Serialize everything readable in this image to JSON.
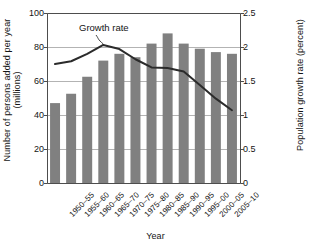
{
  "chart_data": {
    "type": "bar",
    "title": "",
    "xlabel": "Year",
    "ylabel": "Number of persons added per year (millions)",
    "ylabel_secondary": "Population growth rate (percent)",
    "categories": [
      "1950–55",
      "1955–60",
      "1960–65",
      "1965–70",
      "1970–75",
      "1975–80",
      "1980–85",
      "1985–90",
      "1990–95",
      "1995–00",
      "2000–05",
      "2005–10"
    ],
    "series": [
      {
        "name": "Number of persons added per year (millions)",
        "type": "bar",
        "axis": "left",
        "values": [
          47,
          52.5,
          62.5,
          72,
          76,
          74,
          82,
          88,
          82,
          79,
          77,
          76
        ]
      },
      {
        "name": "Growth rate",
        "type": "line",
        "axis": "right",
        "values": [
          1.75,
          1.79,
          1.9,
          2.03,
          1.97,
          1.82,
          1.7,
          1.69,
          1.64,
          1.44,
          1.24,
          1.07
        ]
      }
    ],
    "ylim": [
      0,
      100
    ],
    "yticks": [
      "0",
      "20",
      "40",
      "60",
      "80",
      "100"
    ],
    "ylim_secondary": [
      0,
      2.5
    ],
    "yticks_secondary": [
      "0",
      "0.5",
      "1",
      "1.5",
      "2",
      "2.5"
    ],
    "grid": true,
    "legend": "none",
    "annotations": [
      {
        "text": "Growth rate",
        "target_category": "1965–70"
      }
    ],
    "colors": {
      "bar": "#808080",
      "line": "#2b2b2b",
      "grid": "#b3b3b3",
      "axis": "#4d4d4d",
      "text": "#141414"
    }
  }
}
